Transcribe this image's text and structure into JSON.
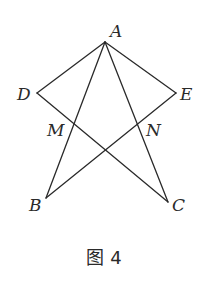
{
  "figure": {
    "caption": "图 4",
    "points": {
      "A": {
        "label": "A",
        "x": 105,
        "y": 42
      },
      "D": {
        "label": "D",
        "x": 37,
        "y": 93
      },
      "E": {
        "label": "E",
        "x": 176,
        "y": 93
      },
      "B": {
        "label": "B",
        "x": 46,
        "y": 198
      },
      "C": {
        "label": "C",
        "x": 168,
        "y": 202
      },
      "M": {
        "label": "M",
        "x": 73,
        "y": 125
      },
      "N": {
        "label": "N",
        "x": 138,
        "y": 125
      }
    },
    "segments": [
      [
        "A",
        "D"
      ],
      [
        "A",
        "E"
      ],
      [
        "A",
        "B"
      ],
      [
        "A",
        "C"
      ],
      [
        "D",
        "C"
      ],
      [
        "E",
        "B"
      ]
    ]
  },
  "labels": {
    "A": "A",
    "B": "B",
    "C": "C",
    "D": "D",
    "E": "E",
    "M": "M",
    "N": "N"
  }
}
